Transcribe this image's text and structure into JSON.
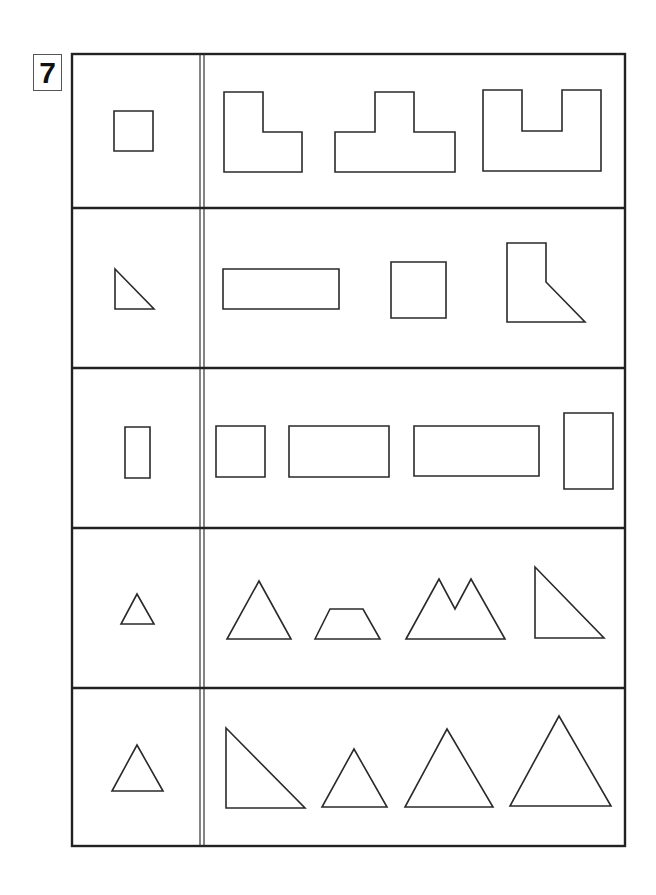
{
  "exercise_number": "7",
  "layout": {
    "frame": {
      "x1": 72,
      "y1": 54,
      "x2": 625,
      "y2": 846
    },
    "column_divider_x": [
      200,
      204
    ],
    "row_dividers_y": [
      208,
      368,
      528,
      688
    ]
  },
  "rows": [
    {
      "reference": {
        "name": "square",
        "points": "114,111 153,111 153,151 114,151"
      },
      "options": [
        {
          "name": "l-shape",
          "points": "224,92 263,92 263,132 302,132 302,172 224,172"
        },
        {
          "name": "t-shape",
          "points": "335,132 375,132 375,92 414,92 414,132 455,132 455,172 335,172"
        },
        {
          "name": "u-shape",
          "points": "483,90 522,90 522,131 562,131 562,90 601,90 601,171 483,171"
        }
      ]
    },
    {
      "reference": {
        "name": "right-triangle",
        "points": "115,269 154,309 115,309"
      },
      "options": [
        {
          "name": "rectangle",
          "points": "223,269 339,269 339,309 223,309"
        },
        {
          "name": "square",
          "points": "391,262 446,262 446,318 391,318"
        },
        {
          "name": "l-shape-with-slant",
          "points": "507,243 546,243 546,282 585,322 507,322"
        }
      ]
    },
    {
      "reference": {
        "name": "tall-rectangle",
        "points": "125,427 150,427 150,478 125,478"
      },
      "options": [
        {
          "name": "square",
          "points": "216,426 265,426 265,477 216,477"
        },
        {
          "name": "rectangle",
          "points": "289,426 389,426 389,477 289,477"
        },
        {
          "name": "long-rectangle",
          "points": "414,426 539,426 539,476 414,476"
        },
        {
          "name": "tall-rectangle",
          "points": "564,413 613,413 613,489 564,489"
        }
      ]
    },
    {
      "reference": {
        "name": "small-triangle",
        "points": "137,594 154,624 121,624"
      },
      "options": [
        {
          "name": "triangle",
          "points": "259,581 291,639 227,639"
        },
        {
          "name": "trapezoid",
          "points": "315,639 330,609 363,609 380,639"
        },
        {
          "name": "m-shape",
          "points": "406,639 439,579 455,609 471,579 505,639"
        },
        {
          "name": "right-triangle",
          "points": "535,567 604,638 535,638"
        }
      ]
    },
    {
      "reference": {
        "name": "triangle",
        "points": "137,745 163,791 112,791"
      },
      "options": [
        {
          "name": "right-triangle",
          "points": "226,728 305,808 226,808"
        },
        {
          "name": "small-triangle",
          "points": "354,749 387,807 322,807"
        },
        {
          "name": "medium-triangle",
          "points": "447,729 493,807 405,807"
        },
        {
          "name": "large-triangle",
          "points": "559,716 611,806 510,806"
        }
      ]
    }
  ]
}
